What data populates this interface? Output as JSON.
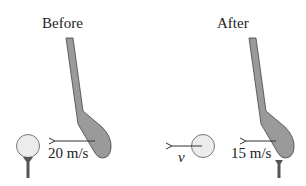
{
  "before": {
    "title": "Before",
    "club_speed_label": "20 m/s"
  },
  "after": {
    "title": "After",
    "club_speed_label": "15 m/s",
    "ball_speed_label": "v"
  },
  "colors": {
    "club_fill": "#9a9a9a",
    "club_stroke": "#444444",
    "ball_fill": "#ececec",
    "ball_stroke": "#777777",
    "tee": "#555555",
    "arrow": "#333333"
  }
}
